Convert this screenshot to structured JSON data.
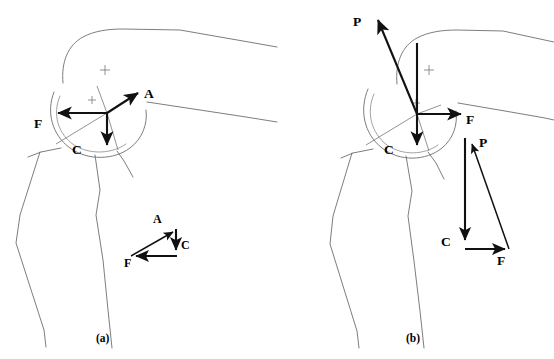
{
  "figure": {
    "background_color": "#ffffff",
    "outline_color": "#6e6e6e",
    "vector_color": "#111111",
    "width": 554,
    "height": 359
  },
  "panels": [
    {
      "id": "a",
      "caption": "(a)",
      "caption_x": 98,
      "caption_y": 341,
      "description": "Femoral head with abductor force A, joint reaction F and body weight C",
      "origin": {
        "x": 107,
        "y": 113
      },
      "vectors": [
        {
          "name": "A",
          "label": "A",
          "x1": 107,
          "y1": 113,
          "x2": 139,
          "y2": 92,
          "label_x": 144,
          "label_y": 97
        },
        {
          "name": "F",
          "label": "F",
          "x1": 107,
          "y1": 113,
          "x2": 56,
          "y2": 113,
          "label_x": 38,
          "label_y": 126
        },
        {
          "name": "C",
          "label": "C",
          "x1": 107,
          "y1": 113,
          "x2": 107,
          "y2": 148,
          "label_x": 76,
          "label_y": 152
        }
      ],
      "triangle": {
        "caption": "force triangle",
        "vectors": [
          {
            "name": "A",
            "label": "A",
            "x1": 133,
            "y1": 255,
            "x2": 176,
            "y2": 231,
            "label_x": 155,
            "label_y": 222
          },
          {
            "name": "C",
            "label": "C",
            "x1": 176,
            "y1": 231,
            "x2": 176,
            "y2": 251,
            "label_x": 181,
            "label_y": 246
          },
          {
            "name": "F",
            "label": "F",
            "x1": 176,
            "y1": 255,
            "x2": 133,
            "y2": 255,
            "label_x": 127,
            "label_y": 265
          }
        ]
      }
    },
    {
      "id": "b",
      "caption": "(b)",
      "caption_x": 408,
      "caption_y": 341,
      "description": "Femoral head with cane/prosthesis force P, joint reaction F and body weight C",
      "origin": {
        "x": 417,
        "y": 114
      },
      "vectors": [
        {
          "name": "P",
          "label": "P",
          "x1": 417,
          "y1": 114,
          "x2": 376,
          "y2": 16,
          "label_x": 357,
          "label_y": 22
        },
        {
          "name": "F",
          "label": "F",
          "x1": 417,
          "y1": 114,
          "x2": 463,
          "y2": 114,
          "label_x": 468,
          "label_y": 122
        },
        {
          "name": "C",
          "label": "C",
          "x1": 417,
          "y1": 43,
          "x2": 417,
          "y2": 148,
          "label_x": 388,
          "label_y": 152
        }
      ],
      "triangle": {
        "caption": "force triangle",
        "vectors": [
          {
            "name": "P",
            "label": "P",
            "x1": 508,
            "y1": 248,
            "x2": 470,
            "y2": 140,
            "label_x": 477,
            "label_y": 143
          },
          {
            "name": "C",
            "label": "C",
            "x1": 465,
            "y1": 140,
            "x2": 465,
            "y2": 243,
            "label_x": 444,
            "label_y": 244
          },
          {
            "name": "F",
            "label": "F",
            "x1": 465,
            "y1": 248,
            "x2": 508,
            "y2": 248,
            "label_x": 500,
            "label_y": 263
          }
        ]
      }
    }
  ],
  "labels": {
    "force_A": "A",
    "force_C": "C",
    "force_F": "F",
    "force_P": "P",
    "panel_a": "(a)",
    "panel_b": "(b)"
  }
}
